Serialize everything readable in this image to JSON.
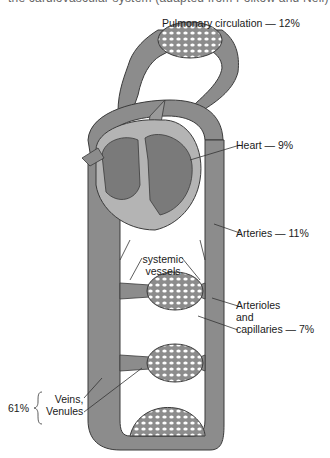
{
  "caption_cut": "the cardiovascular system (adapted from Folkow and Neil)",
  "labels": {
    "pulmonary": "Pulmonary circulation — 12%",
    "heart": "Heart — 9%",
    "arteries": "Arteries — 11%",
    "systemic_line1": "systemic",
    "systemic_line2": "vessels",
    "arterioles_line1": "Arterioles",
    "arterioles_line2": "and",
    "arterioles_line3": "capillaries — 7%",
    "veins_pct": "61%",
    "veins_line1": "Veins,",
    "veins_line2": "Venules"
  },
  "colors": {
    "vessel_fill": "#8c8c8c",
    "vessel_stroke": "#3a3a3a",
    "heart_dark": "#7a7a7a",
    "heart_light": "#b4b4b4",
    "background": "#ffffff"
  }
}
